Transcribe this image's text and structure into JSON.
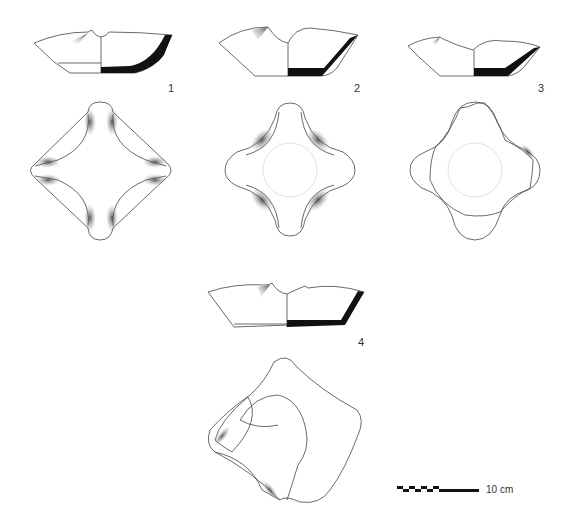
{
  "figures": [
    {
      "number": "1",
      "views": [
        "profile",
        "top-view"
      ]
    },
    {
      "number": "2",
      "views": [
        "profile",
        "top-view"
      ]
    },
    {
      "number": "3",
      "views": [
        "profile",
        "top-view"
      ]
    },
    {
      "number": "4",
      "views": [
        "profile",
        "top-view"
      ]
    }
  ],
  "scale_bar": {
    "label": "10 cm"
  },
  "colors": {
    "line": "#444444",
    "section_fill": "#111111",
    "shading": "#555555"
  }
}
